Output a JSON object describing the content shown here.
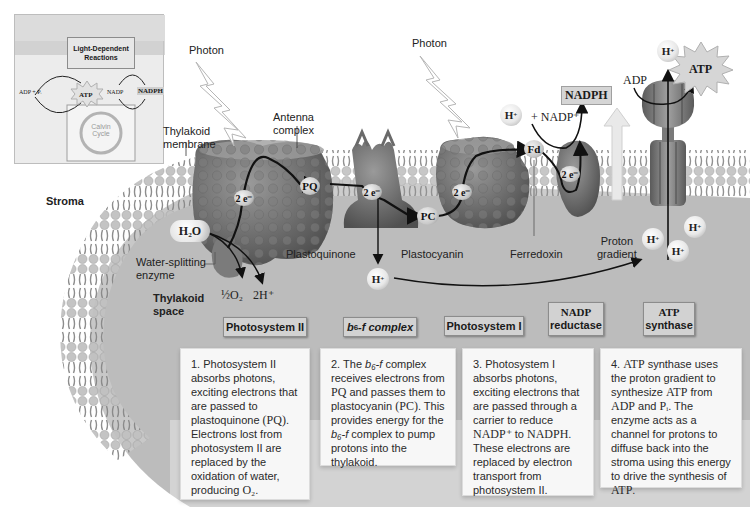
{
  "figure": {
    "colors": {
      "background": "#ffffff",
      "thylakoid_space": "#b9b9b9",
      "membrane": "#e6e6e6",
      "protein": "#6f6f6f",
      "tag_fill": "#d2d2d2",
      "desc_fill": "#f7f7f7",
      "arrow": "#111111"
    }
  },
  "inset": {
    "header": "Light-Dependent Reactions",
    "left_label": "ADP + Pᵢ",
    "atp_label": "ATP",
    "nadp_label": "NADP",
    "nadph_label": "NADPH",
    "cycle_label_1": "Calvin",
    "cycle_label_2": "Cycle"
  },
  "labels": {
    "photon_1": "Photon",
    "photon_2": "Photon",
    "thylakoid_membrane_1": "Thylakoid",
    "thylakoid_membrane_2": "membrane",
    "antenna_complex_1": "Antenna",
    "antenna_complex_2": "complex",
    "stroma": "Stroma",
    "water_splitting_1": "Water-splitting",
    "water_splitting_2": "enzyme",
    "thylakoid_space_1": "Thylakoid",
    "thylakoid_space_2": "space",
    "plastoquinone": "Plastoquinone",
    "plastocyanin": "Plastocyanin",
    "ferredoxin": "Ferredoxin",
    "proton_gradient_1": "Proton",
    "proton_gradient_2": "gradient",
    "half_o2": "½O₂",
    "two_h": "2H⁺",
    "h2o": "H₂O",
    "nadp_plus": "+ NADP⁺",
    "nadph": "NADPH",
    "adp": "ADP",
    "atp": "ATP"
  },
  "carriers": {
    "pq": "PQ",
    "pc": "PC",
    "fd": "Fd",
    "e_ps2": "2 e⁻",
    "e_b6f": "2 e⁻",
    "e_ps1": "2 e⁻",
    "e_ndr": "2 e⁻"
  },
  "ions": {
    "h_lumen_b6f": "H",
    "h_nadp": "H",
    "h_atp_top": "H",
    "h_grad_1": "H",
    "h_grad_2": "H",
    "h_grad_3": "H",
    "plus": "+"
  },
  "complexes": [
    {
      "line1": "Photosystem II",
      "line2": ""
    },
    {
      "line1": "b",
      "sub": "6",
      "line1b": "-f complex"
    },
    {
      "line1": "Photosystem I",
      "line2": ""
    },
    {
      "line1": "NADP",
      "line2": "reductase"
    },
    {
      "line1": "ATP",
      "line2": "synthase"
    }
  ],
  "steps": [
    {
      "num": "1.",
      "text_a": "Photosystem II absorbs photons, exciting electrons that are passed to plastoquinone ",
      "chem_a": "(PQ)",
      "text_b": ". Electrons lost from photosystem II are replaced by the oxidation of water, producing ",
      "chem_b": "O₂",
      "text_c": "."
    },
    {
      "num": "2.",
      "text_a": "The ",
      "ital_a": "b₆-f",
      "text_b": " complex receives electrons from ",
      "chem_a": "PQ",
      "text_c": " and passes them to plastocyanin ",
      "chem_b": "(PC)",
      "text_d": ". This provides energy for the ",
      "ital_b": "b₆-f",
      "text_e": " complex to pump protons into the thylakoid."
    },
    {
      "num": "3.",
      "text_a": "Photosystem I absorbs photons, exciting electrons that are passed through a carrier to reduce ",
      "chem_a": "NADP⁺",
      "text_b": " to ",
      "chem_b": "NADPH",
      "text_c": ". These electrons are replaced by electron transport from photosystem II."
    },
    {
      "num": "4.",
      "chem_a": "ATP",
      "text_a": " synthase uses the proton gradient to synthesize ",
      "chem_b": "ATP",
      "text_b": " from ",
      "chem_c": "ADP",
      "text_c": " and ",
      "chem_d": "Pᵢ",
      "text_d": ". The enzyme acts as a channel for protons to diffuse back into the stroma using this energy to drive the synthesis of ",
      "chem_e": "ATP",
      "text_e": "."
    }
  ]
}
